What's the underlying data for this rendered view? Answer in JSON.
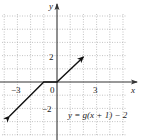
{
  "chart_data": {
    "type": "line",
    "title": "",
    "xlabel": "x",
    "ylabel": "y",
    "xlim": [
      -4.3,
      6.8
    ],
    "ylim": [
      -4.2,
      6.2
    ],
    "grid": true,
    "grid_style": "dotted",
    "x_ticks": [
      {
        "value": -3,
        "label": "−3"
      },
      {
        "value": 0,
        "label": "0"
      },
      {
        "value": 3,
        "label": "3"
      }
    ],
    "y_ticks": [
      {
        "value": 2,
        "label": "2"
      },
      {
        "value": -2,
        "label": "−2"
      }
    ],
    "series": [
      {
        "name": "y = g(x + 1) − 2",
        "points": [
          [
            -3.6,
            -2.6
          ],
          [
            -1,
            0
          ],
          [
            0,
            0
          ],
          [
            2,
            1.9
          ]
        ],
        "arrow_start": true,
        "arrow_end": true
      }
    ],
    "annotations": [
      {
        "text": "y = g(x + 1) − 2",
        "x": 2.7,
        "y": -2.3
      }
    ]
  },
  "labels": {
    "x_axis": "x",
    "y_axis": "y",
    "tick_neg3": "−3",
    "tick_0": "0",
    "tick_3": "3",
    "tick_2": "2",
    "tick_neg2": "−2",
    "equation": "y = g(x + 1) − 2"
  },
  "colors": {
    "grid": "#9a9a9a",
    "axis": "#333333",
    "curve": "#111111"
  }
}
